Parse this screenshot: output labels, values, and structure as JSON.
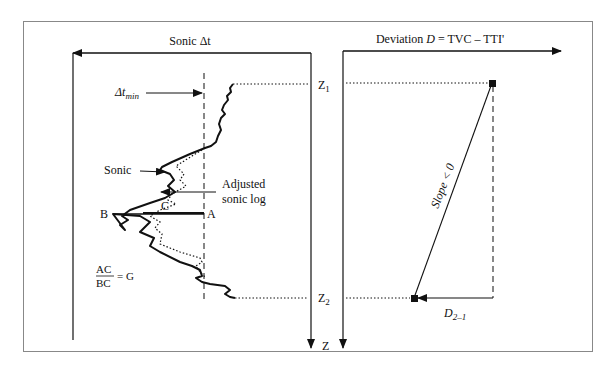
{
  "left_panel": {
    "axis_title": "Sonic Δt",
    "dt_min_label": "Δt",
    "dt_min_sub": "min",
    "sonic_label": "Sonic",
    "adjusted_label_line1": "Adjusted",
    "adjusted_label_line2": "sonic log",
    "point_b": "B",
    "point_c": "C",
    "point_a": "A",
    "ratio_numerator": "AC",
    "ratio_denominator": "BC",
    "ratio_equals": "= G",
    "z1_label": "Z",
    "z1_sub": "1",
    "z2_label": "Z",
    "z2_sub": "2",
    "z_axis_label": "Z"
  },
  "right_panel": {
    "axis_title_prefix": "Deviation ",
    "axis_title_var": "D",
    "axis_title_suffix": " = TVC – TTI'",
    "slope_label": "Slope < 0",
    "d21_label": "D",
    "d21_sub": "2–1"
  },
  "colors": {
    "line": "#111111",
    "frame": "#888888",
    "background": "#ffffff"
  }
}
